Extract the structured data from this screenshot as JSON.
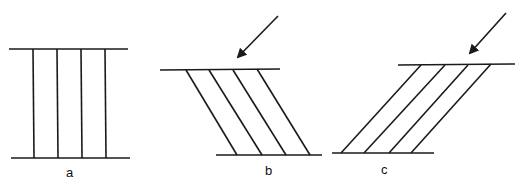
{
  "panels": [
    {
      "id": "a",
      "label": "a"
    },
    {
      "id": "b",
      "label": "b"
    },
    {
      "id": "c",
      "label": "c"
    }
  ],
  "colors": {
    "stroke": "#1a1a1a",
    "background": "#ffffff"
  }
}
